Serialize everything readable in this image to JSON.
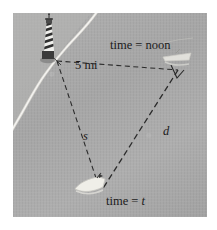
{
  "figure": {
    "kind": "math-word-problem-illustration",
    "scene": "Aerial photo of a coastline with a lighthouse on shore and two boat positions forming a right triangle",
    "background_color": "#a9a9a9",
    "mat_color": "#ffffff",
    "ink_color": "#1b1b1b",
    "shore_color": "#d8d8d4"
  },
  "labels": {
    "time_noon": "time = noon",
    "distance_top": "5 mi",
    "time_t": "time = t",
    "side_s": "s",
    "side_d": "d"
  },
  "icons": {
    "lighthouse": "lighthouse-icon",
    "boat_noon": "boat-icon",
    "boat_t": "boat-icon",
    "right_angle": "right-angle-marker-icon",
    "shoreline": "shoreline-icon"
  },
  "geometry": {
    "vertex_lighthouse": [
      44,
      48
    ],
    "vertex_boat_noon": [
      167,
      58
    ],
    "vertex_boat_t": [
      88,
      178
    ],
    "segments": [
      {
        "name": "5 mi",
        "from": "lighthouse",
        "to": "boat_noon",
        "style": "dashed"
      },
      {
        "name": "s",
        "from": "lighthouse",
        "to": "boat_t",
        "style": "dashed"
      },
      {
        "name": "d",
        "from": "boat_noon",
        "to": "boat_t",
        "style": "dashed"
      }
    ]
  }
}
